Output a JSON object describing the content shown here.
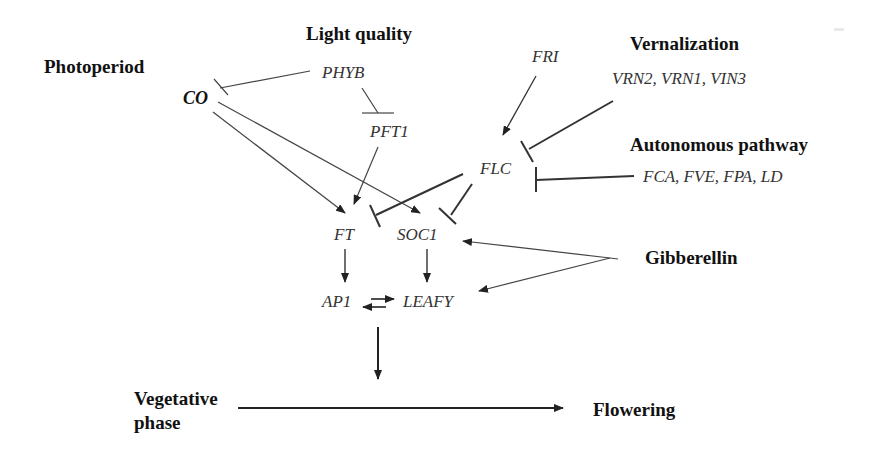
{
  "diagram": {
    "pathways": {
      "photoperiod": "Photoperiod",
      "light_quality": "Light quality",
      "vernalization": "Vernalization",
      "autonomous": "Autonomous pathway",
      "gibberellin": "Gibberellin"
    },
    "genes": {
      "co": "CO",
      "phyb": "PHYB",
      "pft1": "PFT1",
      "fri": "FRI",
      "flc": "FLC",
      "vrn_group": "VRN2, VRN1, VIN3",
      "auto_group": "FCA, FVE, FPA, LD",
      "ft": "FT",
      "soc1": "SOC1",
      "ap1": "AP1",
      "leafy": "LEAFY"
    },
    "phases": {
      "vegetative_line1": "Vegetative",
      "vegetative_line2": "phase",
      "flowering": "Flowering"
    },
    "edges": [
      {
        "from": "PHYB",
        "to": "CO",
        "type": "inhibition"
      },
      {
        "from": "PHYB",
        "to": "PFT1",
        "type": "inhibition"
      },
      {
        "from": "CO",
        "to": "FT",
        "type": "activation"
      },
      {
        "from": "CO",
        "to": "SOC1",
        "type": "activation"
      },
      {
        "from": "PFT1",
        "to": "FT",
        "type": "activation"
      },
      {
        "from": "FRI",
        "to": "FLC",
        "type": "activation"
      },
      {
        "from": "VRN2, VRN1, VIN3",
        "to": "FLC",
        "type": "inhibition"
      },
      {
        "from": "FCA, FVE, FPA, LD",
        "to": "FLC",
        "type": "inhibition"
      },
      {
        "from": "FLC",
        "to": "FT",
        "type": "inhibition"
      },
      {
        "from": "FLC",
        "to": "SOC1",
        "type": "inhibition"
      },
      {
        "from": "Gibberellin",
        "to": "SOC1",
        "type": "activation"
      },
      {
        "from": "Gibberellin",
        "to": "LEAFY",
        "type": "activation"
      },
      {
        "from": "FT",
        "to": "AP1",
        "type": "activation"
      },
      {
        "from": "SOC1",
        "to": "LEAFY",
        "type": "activation"
      },
      {
        "from": "AP1",
        "to": "LEAFY",
        "type": "mutual-activation"
      },
      {
        "from": "AP1/LEAFY",
        "to": "transition",
        "type": "activation"
      },
      {
        "from": "Vegetative phase",
        "to": "Flowering",
        "type": "transition"
      }
    ],
    "colors": {
      "line": "#333333",
      "text": "#111111",
      "gene_text": "#333333",
      "background": "#ffffff"
    }
  }
}
